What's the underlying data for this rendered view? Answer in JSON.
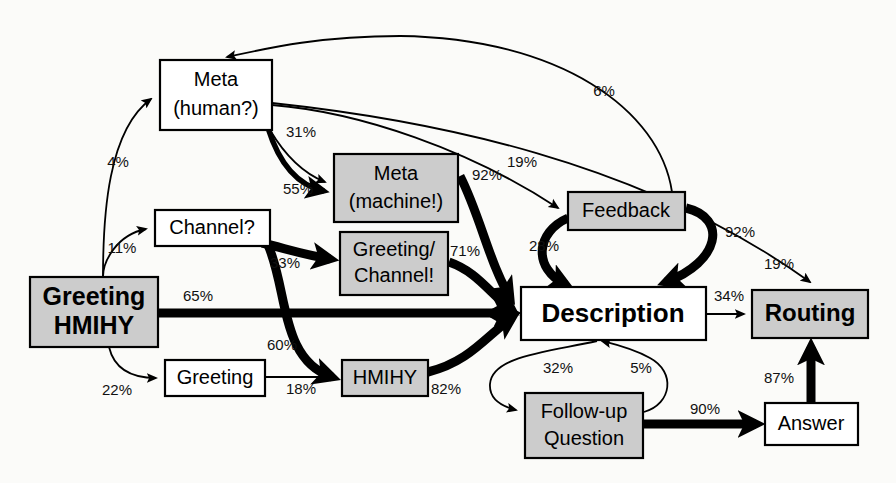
{
  "diagram": {
    "type": "state-transition-graph",
    "colors": {
      "shaded_fill": "#cccccc",
      "plain_fill": "#ffffff",
      "stroke": "#000000",
      "background": "#fbfbf9"
    },
    "nodes": [
      {
        "id": "greeting_hmihy",
        "label_line1": "Greeting",
        "label_line2": "HMIHY",
        "shaded": true,
        "bold": true,
        "x": 30,
        "y": 277,
        "w": 128,
        "h": 70,
        "font_size": 25
      },
      {
        "id": "meta_human",
        "label_line1": "Meta",
        "label_line2": "(human?)",
        "shaded": false,
        "bold": false,
        "x": 160,
        "y": 60,
        "w": 112,
        "h": 70,
        "font_size": 20
      },
      {
        "id": "channel_q",
        "label_line1": "Channel?",
        "label_line2": "",
        "shaded": false,
        "bold": false,
        "x": 155,
        "y": 210,
        "w": 115,
        "h": 36,
        "font_size": 20
      },
      {
        "id": "greeting",
        "label_line1": "Greeting",
        "label_line2": "",
        "shaded": false,
        "bold": false,
        "x": 165,
        "y": 360,
        "w": 100,
        "h": 36,
        "font_size": 20
      },
      {
        "id": "meta_machine",
        "label_line1": "Meta",
        "label_line2": "(machine!)",
        "shaded": true,
        "bold": false,
        "x": 334,
        "y": 154,
        "w": 124,
        "h": 68,
        "font_size": 20
      },
      {
        "id": "greeting_channel",
        "label_line1": "Greeting/",
        "label_line2": "Channel!",
        "shaded": true,
        "bold": false,
        "x": 340,
        "y": 232,
        "w": 108,
        "h": 63,
        "font_size": 20
      },
      {
        "id": "hmihy",
        "label_line1": "HMIHY",
        "label_line2": "",
        "shaded": true,
        "bold": false,
        "x": 342,
        "y": 360,
        "w": 86,
        "h": 36,
        "font_size": 20
      },
      {
        "id": "feedback",
        "label_line1": "Feedback",
        "label_line2": "",
        "shaded": true,
        "bold": false,
        "x": 568,
        "y": 192,
        "w": 117,
        "h": 38,
        "font_size": 20
      },
      {
        "id": "description",
        "label_line1": "Description",
        "label_line2": "",
        "shaded": false,
        "bold": true,
        "x": 521,
        "y": 287,
        "w": 185,
        "h": 53,
        "font_size": 26
      },
      {
        "id": "routing",
        "label_line1": "Routing",
        "label_line2": "",
        "shaded": true,
        "bold": true,
        "x": 752,
        "y": 290,
        "w": 116,
        "h": 48,
        "font_size": 24
      },
      {
        "id": "followup",
        "label_line1": "Follow-up",
        "label_line2": "Question",
        "shaded": true,
        "bold": false,
        "x": 525,
        "y": 393,
        "w": 118,
        "h": 65,
        "font_size": 20
      },
      {
        "id": "answer",
        "label_line1": "Answer",
        "label_line2": "",
        "shaded": false,
        "bold": false,
        "x": 765,
        "y": 403,
        "w": 93,
        "h": 42,
        "font_size": 20
      }
    ],
    "edges": [
      {
        "id": "e_ghmihy_meta_human",
        "from": "greeting_hmihy",
        "to": "meta_human",
        "percent": "4%",
        "weight": "thin",
        "label_x": 118,
        "label_y": 163
      },
      {
        "id": "e_ghmihy_channel",
        "from": "greeting_hmihy",
        "to": "channel_q",
        "percent": "11%",
        "weight": "thin",
        "label_x": 122,
        "label_y": 249
      },
      {
        "id": "e_ghmihy_desc",
        "from": "greeting_hmihy",
        "to": "description",
        "percent": "65%",
        "weight": "thick",
        "label_x": 198,
        "label_y": 297
      },
      {
        "id": "e_ghmihy_greeting",
        "from": "greeting_hmihy",
        "to": "greeting",
        "percent": "22%",
        "weight": "thin",
        "label_x": 117,
        "label_y": 391
      },
      {
        "id": "e_metahuman_metamach",
        "from": "meta_human",
        "to": "meta_machine",
        "percent": "31%",
        "weight": "thin",
        "label_x": 301,
        "label_y": 133
      },
      {
        "id": "e_metahuman_metamach2",
        "from": "meta_human",
        "to": "meta_machine",
        "percent": "55%",
        "weight": "med",
        "label_x": 298,
        "label_y": 190
      },
      {
        "id": "e_metahuman_feedback",
        "from": "meta_human",
        "to": "feedback",
        "percent": "19%",
        "weight": "thin",
        "label_x": 522,
        "label_y": 163
      },
      {
        "id": "e_metahuman_routing",
        "from": "meta_human",
        "to": "routing",
        "percent": "19%",
        "weight": "thin",
        "label_x": 779,
        "label_y": 265
      },
      {
        "id": "e_metamach_desc",
        "from": "meta_machine",
        "to": "description",
        "percent": "92%",
        "weight": "thick",
        "label_x": 487,
        "label_y": 176
      },
      {
        "id": "e_channel_gc",
        "from": "channel_q",
        "to": "greeting_channel",
        "percent": "33%",
        "weight": "thick",
        "label_x": 285,
        "label_y": 264
      },
      {
        "id": "e_channel_hmihy",
        "from": "channel_q",
        "to": "hmihy",
        "percent": "60%",
        "weight": "thick",
        "label_x": 282,
        "label_y": 346
      },
      {
        "id": "e_gc_desc",
        "from": "greeting_channel",
        "to": "description",
        "percent": "71%",
        "weight": "thick",
        "label_x": 465,
        "label_y": 252
      },
      {
        "id": "e_greeting_hmihy2",
        "from": "greeting",
        "to": "hmihy",
        "percent": "18%",
        "weight": "thin",
        "label_x": 301,
        "label_y": 390
      },
      {
        "id": "e_hmihy_desc",
        "from": "hmihy",
        "to": "description",
        "percent": "82%",
        "weight": "thick",
        "label_x": 446,
        "label_y": 390
      },
      {
        "id": "e_feedback_desc",
        "from": "feedback",
        "to": "description",
        "percent": "28%",
        "weight": "thick",
        "label_x": 544,
        "label_y": 247
      },
      {
        "id": "e_feedback_routing",
        "from": "feedback",
        "to": "routing",
        "percent": "92%",
        "weight": "thick",
        "label_x": 740,
        "label_y": 233
      },
      {
        "id": "e_feedback_metahuman",
        "from": "feedback",
        "to": "meta_human",
        "percent": "6%",
        "weight": "thin",
        "label_x": 604,
        "label_y": 92
      },
      {
        "id": "e_desc_routing",
        "from": "description",
        "to": "routing",
        "percent": "34%",
        "weight": "thin",
        "label_x": 729,
        "label_y": 297
      },
      {
        "id": "e_desc_followup",
        "from": "description",
        "to": "followup",
        "percent": "32%",
        "weight": "thin",
        "label_x": 558,
        "label_y": 369
      },
      {
        "id": "e_followup_desc",
        "from": "followup",
        "to": "description",
        "percent": "5%",
        "weight": "thin",
        "label_x": 641,
        "label_y": 369
      },
      {
        "id": "e_followup_answer",
        "from": "followup",
        "to": "answer",
        "percent": "90%",
        "weight": "thick",
        "label_x": 705,
        "label_y": 410
      },
      {
        "id": "e_answer_routing",
        "from": "answer",
        "to": "routing",
        "percent": "87%",
        "weight": "thick",
        "label_x": 779,
        "label_y": 379
      }
    ]
  }
}
